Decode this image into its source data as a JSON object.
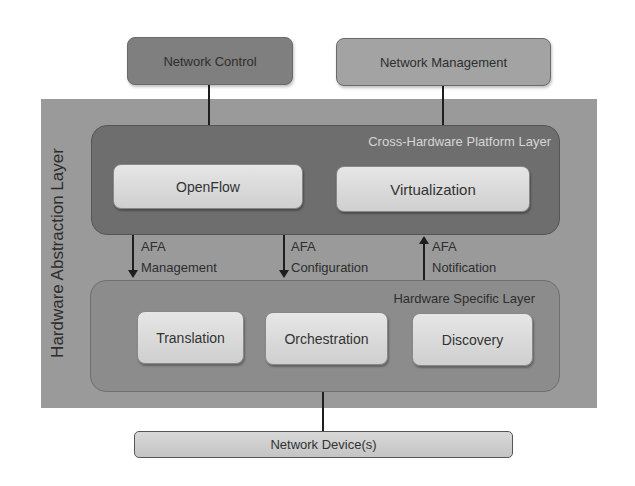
{
  "diagram": {
    "top_nodes": {
      "network_control": "Network Control",
      "network_management": "Network Management"
    },
    "hardware_abstraction_layer": {
      "label": "Hardware Abstraction Layer",
      "cross_hardware_platform_layer": {
        "label": "Cross-Hardware Platform Layer",
        "components": [
          "OpenFlow",
          "Virtualization"
        ]
      },
      "interfaces": [
        {
          "line1": "AFA",
          "line2": "Management",
          "direction": "down"
        },
        {
          "line1": "AFA",
          "line2": "Configuration",
          "direction": "down"
        },
        {
          "line1": "AFA",
          "line2": "Notification",
          "direction": "up"
        }
      ],
      "hardware_specific_layer": {
        "label": "Hardware Specific Layer",
        "components": [
          "Translation",
          "Orchestration",
          "Discovery"
        ]
      }
    },
    "bottom_node": "Network Device(s)",
    "colors": {
      "network_control": "#7f7f7f",
      "network_management": "#a3a3a3",
      "hal_background": "#9a9a9a",
      "cross_layer": "#6e6e6e",
      "hw_specific_layer": "#8c8c8c",
      "component_box": "#dcdcdc"
    }
  }
}
